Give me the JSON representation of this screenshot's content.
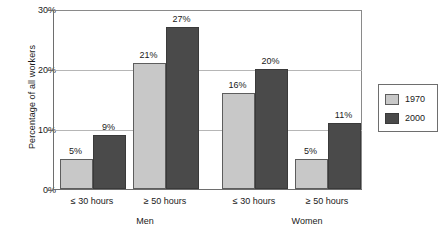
{
  "chart_data": {
    "type": "bar",
    "title": "",
    "subtitle": "",
    "xlabel": "",
    "ylabel": "Percentage of all workers",
    "ylim": [
      0,
      30
    ],
    "y_ticks": [
      "0%",
      "10%",
      "20%",
      "30%"
    ],
    "y_tick_values": [
      0,
      10,
      20,
      30
    ],
    "grid": true,
    "legend_position": "right",
    "categories": [
      "≤ 30 hours",
      "≥ 50 hours",
      "≤ 30 hours",
      "≥ 50 hours"
    ],
    "groups": [
      "Men",
      "Women"
    ],
    "series": [
      {
        "name": "1970",
        "color": "#c8c8c8",
        "values": [
          5,
          21,
          16,
          5
        ],
        "labels": [
          "5%",
          "21%",
          "16%",
          "5%"
        ]
      },
      {
        "name": "2000",
        "color": "#4a4a4a",
        "values": [
          9,
          27,
          20,
          11
        ],
        "labels": [
          "9%",
          "27%",
          "20%",
          "11%"
        ]
      }
    ]
  },
  "axis": {
    "y_title": "Percentage of all workers",
    "y_ticks": [
      {
        "label": "30%",
        "value": 30
      },
      {
        "label": "20%",
        "value": 20
      },
      {
        "label": "10%",
        "value": 10
      },
      {
        "label": "0%",
        "value": 0
      }
    ]
  },
  "x_axis": {
    "categories": [
      {
        "label": "≤ 30 hours"
      },
      {
        "label": "≥ 50 hours"
      },
      {
        "label": "≤ 30 hours"
      },
      {
        "label": "≥ 50 hours"
      }
    ],
    "groups": [
      {
        "label": "Men"
      },
      {
        "label": "Women"
      }
    ]
  },
  "legend": {
    "entries": [
      {
        "label": "1970",
        "color": "#c8c8c8"
      },
      {
        "label": "2000",
        "color": "#4a4a4a"
      }
    ]
  },
  "bars": [
    {
      "label": "5%",
      "value": 5,
      "series": "1970",
      "group": "Men",
      "category": "≤ 30 hours"
    },
    {
      "label": "9%",
      "value": 9,
      "series": "2000",
      "group": "Men",
      "category": "≤ 30 hours"
    },
    {
      "label": "21%",
      "value": 21,
      "series": "1970",
      "group": "Men",
      "category": "≥ 50 hours"
    },
    {
      "label": "27%",
      "value": 27,
      "series": "2000",
      "group": "Men",
      "category": "≥ 50 hours"
    },
    {
      "label": "16%",
      "value": 16,
      "series": "1970",
      "group": "Women",
      "category": "≤ 30 hours"
    },
    {
      "label": "20%",
      "value": 20,
      "series": "2000",
      "group": "Women",
      "category": "≤ 30 hours"
    },
    {
      "label": "5%",
      "value": 5,
      "series": "1970",
      "group": "Women",
      "category": "≥ 50 hours"
    },
    {
      "label": "11%",
      "value": 11,
      "series": "2000",
      "group": "Women",
      "category": "≥ 50 hours"
    }
  ]
}
